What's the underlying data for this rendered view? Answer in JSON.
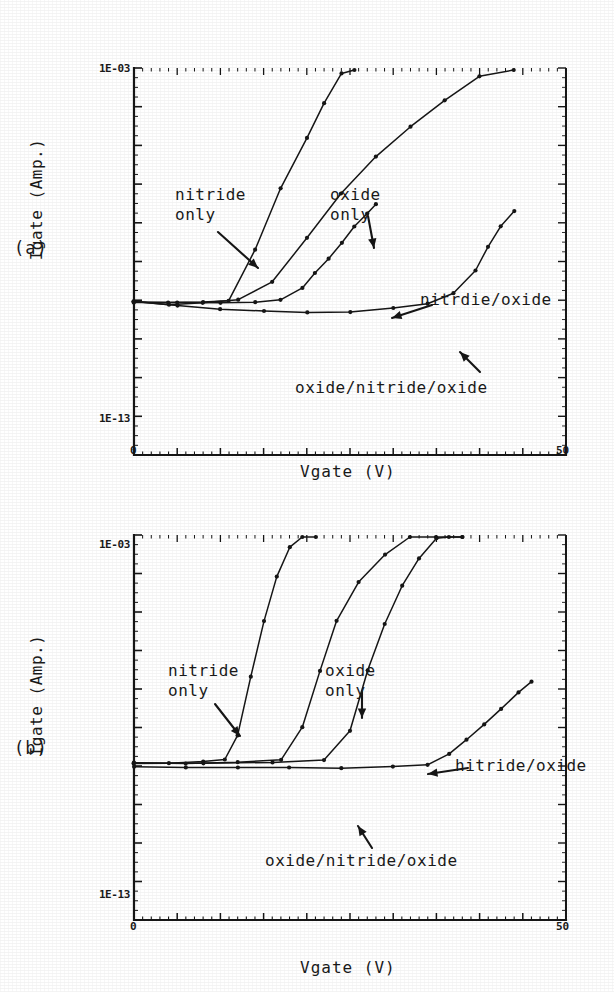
{
  "figure": {
    "panels": [
      {
        "tag": "(a)",
        "ylabel": "Igate (Amp.)",
        "xlabel": "Vgate (V)",
        "ytick_top": "1E-03",
        "ytick_bottom": "1E-13",
        "xtick_left": "0",
        "xtick_right": "50",
        "labels": {
          "nitride": "nitride\nonly",
          "oxide": "oxide\nonly",
          "nitride_oxide": "nitrdie/oxide",
          "ono": "oxide/nitride/oxide"
        }
      },
      {
        "tag": "(b)",
        "ylabel": "Igate (Amp.)",
        "xlabel": "Vgate (V)",
        "ytick_top": "1E-03",
        "ytick_bottom": "1E-13",
        "xtick_left": "0",
        "xtick_right": "50",
        "labels": {
          "nitride": "nitride\nonly",
          "oxide": "oxide\nonly",
          "nitride_oxide": "hitride/oxide",
          "ono": "oxide/nitride/oxide"
        }
      }
    ]
  },
  "chart_data": [
    {
      "type": "line",
      "title": "(a)",
      "xlabel": "Vgate (V)",
      "ylabel": "Igate (Amp.)",
      "xlim": [
        0,
        50
      ],
      "ylim_log": [
        1e-13,
        0.001
      ],
      "yscale": "log",
      "grid": false,
      "legend": "inline-annotations",
      "series": [
        {
          "name": "nitride only",
          "x": [
            0,
            4,
            8,
            11,
            14,
            17,
            20,
            22,
            24,
            25.5
          ],
          "y": [
            9e-10,
            8.5e-10,
            9e-10,
            1e-09,
            2e-08,
            8e-07,
            1.5e-05,
            0.00012,
            0.0007,
            0.002
          ]
        },
        {
          "name": "oxide only",
          "x": [
            0,
            4,
            8,
            12,
            16,
            20,
            24,
            28,
            32,
            36,
            40,
            44
          ],
          "y": [
            9e-10,
            8e-10,
            8.5e-10,
            1e-09,
            3e-09,
            4e-08,
            6e-07,
            5e-06,
            3e-05,
            0.00015,
            0.0006,
            0.002
          ]
        },
        {
          "name": "nitrdie/oxide",
          "x": [
            0,
            5,
            10,
            14,
            17,
            19.5,
            21,
            22.5,
            24,
            25.5,
            27,
            28
          ],
          "y": [
            9e-10,
            8.5e-10,
            8.5e-10,
            9e-10,
            1e-09,
            2e-09,
            5e-09,
            1.2e-08,
            3e-08,
            8e-08,
            1.8e-07,
            3e-07
          ]
        },
        {
          "name": "oxide/nitride/oxide",
          "x": [
            0,
            5,
            10,
            15,
            20,
            25,
            30,
            34,
            37,
            39.5,
            41,
            42.5,
            44
          ],
          "y": [
            9e-10,
            7e-10,
            6e-10,
            5.5e-10,
            5e-10,
            5e-10,
            6e-10,
            8e-10,
            1.5e-09,
            6e-09,
            2.5e-08,
            8e-08,
            2e-07
          ]
        }
      ]
    },
    {
      "type": "line",
      "title": "(b)",
      "xlabel": "Vgate (V)",
      "ylabel": "Igate (Amp.)",
      "xlim": [
        0,
        50
      ],
      "ylim_log": [
        1e-13,
        0.001
      ],
      "yscale": "log",
      "grid": false,
      "legend": "inline-annotations",
      "series": [
        {
          "name": "nitride only",
          "x": [
            0,
            4,
            8,
            10.5,
            12,
            13.5,
            15,
            16.5,
            18,
            19.5,
            21
          ],
          "y": [
            1.2e-09,
            1.2e-09,
            1.3e-09,
            1.5e-09,
            6e-09,
            2e-07,
            6e-06,
            8e-05,
            0.0005,
            0.0014,
            0.003
          ]
        },
        {
          "name": "oxide only",
          "x": [
            0,
            6,
            12,
            17,
            19.5,
            21.5,
            23.5,
            26,
            29,
            32,
            35,
            38
          ],
          "y": [
            1.2e-09,
            1.2e-09,
            1.2e-09,
            1.5e-09,
            1e-08,
            3e-07,
            6e-06,
            6e-05,
            0.0003,
            0.0009,
            0.002,
            0.0035
          ]
        },
        {
          "name": "hitride/oxide",
          "x": [
            0,
            8,
            16,
            22,
            25,
            27,
            29,
            31,
            33,
            35,
            36.5,
            38
          ],
          "y": [
            1.2e-09,
            1.2e-09,
            1.2e-09,
            1.4e-09,
            8e-09,
            3e-07,
            5e-06,
            5e-05,
            0.00025,
            0.0008,
            0.0016,
            0.0026
          ]
        },
        {
          "name": "oxide/nitride/oxide",
          "x": [
            0,
            6,
            12,
            18,
            24,
            30,
            34,
            36.5,
            38.5,
            40.5,
            42.5,
            44.5,
            46
          ],
          "y": [
            1e-09,
            9.5e-10,
            9e-10,
            9e-10,
            9e-10,
            9.5e-10,
            1.1e-09,
            2e-09,
            5e-09,
            1.2e-08,
            3e-08,
            8e-08,
            1.6e-07
          ]
        }
      ]
    }
  ]
}
